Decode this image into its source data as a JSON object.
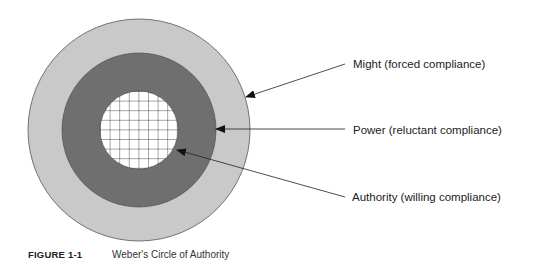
{
  "diagram": {
    "type": "concentric-circles",
    "rings": [
      {
        "name": "Might",
        "description": "forced compliance",
        "label": "Might (forced compliance)",
        "fill": "#c9c9c9",
        "pattern": "solid"
      },
      {
        "name": "Power",
        "description": "reluctant compliance",
        "label": "Power (reluctant compliance)",
        "fill": "#6f6f6f",
        "pattern": "solid"
      },
      {
        "name": "Authority",
        "description": "willing compliance",
        "label": "Authority (willing compliance)",
        "fill": "#ffffff",
        "pattern": "grid"
      }
    ],
    "stroke": "#444444",
    "grid_color": "#222222"
  },
  "caption": {
    "figure_number": "FIGURE 1-1",
    "title": "Weber's Circle of Authority"
  }
}
